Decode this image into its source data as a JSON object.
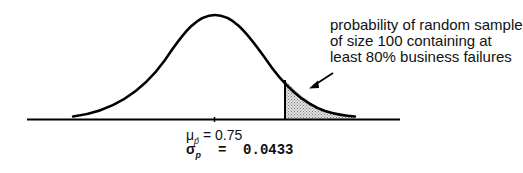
{
  "diagram": {
    "type": "normal-distribution",
    "annotation": {
      "lines": [
        "probability of random sample",
        "of size 100 containing at",
        "least 80% business failures"
      ]
    },
    "mean_label": {
      "symbol": "μ",
      "subscript": "p̂",
      "equals": " = ",
      "value": "0.75"
    },
    "sd_label": {
      "symbol": "σ",
      "subscript": "p",
      "equals": "  =  ",
      "value": "0.0433"
    },
    "shaded_region": "right tail beyond 0.80",
    "colors": {
      "line": "#000000",
      "shade": "#c8c8c8"
    }
  }
}
